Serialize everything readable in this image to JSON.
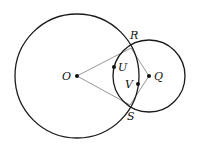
{
  "diagram": {
    "type": "geometry",
    "colors": {
      "circle": "#1a1a1a",
      "segment": "#8a8a8a",
      "point": "#111111",
      "background": "#ffffff"
    },
    "circles": [
      {
        "name": "circle-O",
        "center": "O",
        "cx": 77,
        "cy": 76,
        "r": 62
      },
      {
        "name": "circle-Q",
        "center": "Q",
        "cx": 149,
        "cy": 76,
        "r": 36
      }
    ],
    "points": {
      "O": {
        "label": "O",
        "x": 77,
        "y": 76,
        "lx": 62,
        "ly": 80,
        "dot": true
      },
      "Q": {
        "label": "Q",
        "x": 149,
        "y": 76,
        "lx": 154,
        "ly": 80,
        "dot": true
      },
      "R": {
        "label": "R",
        "x": 131,
        "y": 48,
        "lx": 130,
        "ly": 39,
        "dot": false
      },
      "S": {
        "label": "S",
        "x": 130,
        "y": 105,
        "lx": 127,
        "ly": 120,
        "dot": false
      },
      "U": {
        "label": "U",
        "x": 114,
        "y": 67,
        "lx": 118,
        "ly": 71,
        "dot": true
      },
      "V": {
        "label": "V",
        "x": 138,
        "y": 84,
        "lx": 125,
        "ly": 88,
        "dot": true
      }
    },
    "segments": [
      {
        "name": "segment-OR",
        "from": "O",
        "to": "R"
      },
      {
        "name": "segment-OS",
        "from": "O",
        "to": "S"
      },
      {
        "name": "segment-QR",
        "from": "Q",
        "to": "R"
      },
      {
        "name": "segment-QS",
        "from": "Q",
        "to": "S"
      }
    ]
  }
}
